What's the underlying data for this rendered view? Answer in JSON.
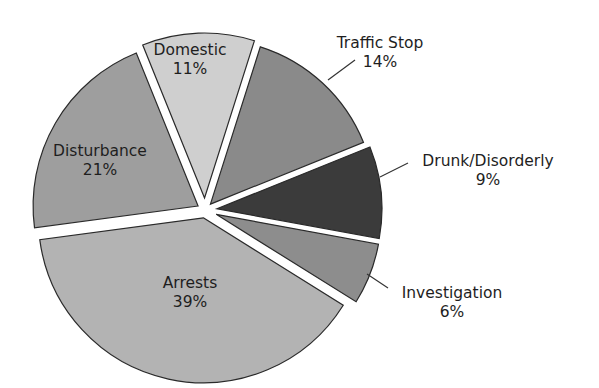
{
  "chart_data": {
    "type": "pie",
    "title": "",
    "center": [
      205,
      210
    ],
    "radius": 165,
    "start_angle_deg": -22,
    "explode_px": 7,
    "slices": [
      {
        "label": "Domestic",
        "value": 11,
        "pct_text": "11%",
        "color": "#cfcfcf",
        "label_pos": "inside",
        "lx": 190,
        "ly": 55,
        "offset": 12
      },
      {
        "label": "Traffic Stop",
        "value": 14,
        "pct_text": "14%",
        "color": "#8a8a8a",
        "label_pos": "outside",
        "lx": 380,
        "ly": 48,
        "leader": [
          [
            328,
            80
          ],
          [
            355,
            60
          ]
        ],
        "offset": 8
      },
      {
        "label": "Drunk/Disorderly",
        "value": 9,
        "pct_text": "9%",
        "color": "#3b3b3b",
        "label_pos": "outside",
        "lx": 488,
        "ly": 166,
        "leader": [
          [
            380,
            177
          ],
          [
            408,
            163
          ]
        ],
        "offset": 12
      },
      {
        "label": "Investigation",
        "value": 6,
        "pct_text": "6%",
        "color": "#8d8d8d",
        "label_pos": "outside",
        "lx": 452,
        "ly": 298,
        "leader": [
          [
            367,
            274
          ],
          [
            388,
            288
          ]
        ],
        "offset": 12
      },
      {
        "label": "Arrests",
        "value": 39,
        "pct_text": "39%",
        "color": "#b3b3b3",
        "label_pos": "inside",
        "lx": 190,
        "ly": 288,
        "offset": 8
      },
      {
        "label": "Disturbance",
        "value": 21,
        "pct_text": "21%",
        "color": "#9e9e9e",
        "label_pos": "inside",
        "lx": 100,
        "ly": 156,
        "offset": 8
      }
    ]
  }
}
